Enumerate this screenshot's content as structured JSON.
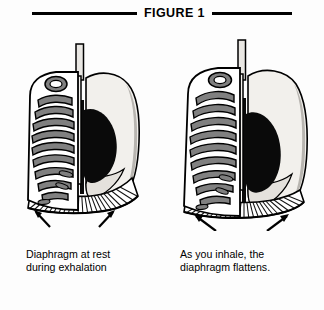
{
  "figure": {
    "title": "FIGURE 1",
    "rule_color": "#000000"
  },
  "panels": [
    {
      "id": "at-rest",
      "caption_line1": "Diaphragm at rest",
      "caption_line2": "during exhalation",
      "diaphragm_state": "domed / relaxed",
      "arrow_count": 2
    },
    {
      "id": "inhaling",
      "caption_line1": "As you inhale, the",
      "caption_line2": "diaphragm flattens.",
      "diaphragm_state": "flattened / contracted",
      "arrow_count": 2
    }
  ],
  "colors": {
    "background": "#fdfdfd",
    "outline": "#000000",
    "rib_fill": "#808080",
    "rib_gap": "#ffffff",
    "lung_fill": "#f2f0ec",
    "lung_shade": "#b8b5b0",
    "heart_fill": "#0a0a0a",
    "diaphragm_hatch": "#111111"
  },
  "anatomy_labels": {
    "trachea": "trachea",
    "clavicle": "clavicle",
    "ribcage": "ribcage",
    "sternum": "sternum",
    "lung": "lung",
    "heart": "heart",
    "diaphragm": "diaphragm"
  }
}
